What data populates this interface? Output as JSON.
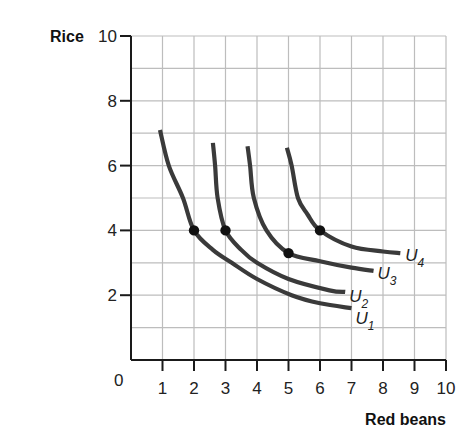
{
  "chart_data": {
    "type": "line",
    "title": "",
    "xlabel": "Red beans",
    "ylabel": "Rice",
    "xlim": [
      0,
      10
    ],
    "ylim": [
      0,
      10
    ],
    "grid": true,
    "x_ticks": [
      "0",
      "1",
      "2",
      "3",
      "4",
      "5",
      "6",
      "7",
      "8",
      "9",
      "10"
    ],
    "y_ticks": [
      "2",
      "4",
      "6",
      "8",
      "10"
    ],
    "origin_label": "0",
    "legend": "none (curves labeled inline)",
    "series": [
      {
        "name": "U1",
        "label_main": "U",
        "label_sub": "1",
        "points": [
          [
            0.92,
            7.1
          ],
          [
            1.2,
            6.0
          ],
          [
            1.65,
            5.0
          ],
          [
            2.0,
            4.0
          ],
          [
            2.6,
            3.4
          ],
          [
            3.2,
            3.0
          ],
          [
            4.0,
            2.5
          ],
          [
            5.1,
            2.0
          ],
          [
            6.0,
            1.75
          ],
          [
            7.0,
            1.6
          ]
        ]
      },
      {
        "name": "U2",
        "label_main": "U",
        "label_sub": "2",
        "points": [
          [
            2.6,
            6.7
          ],
          [
            2.67,
            6.0
          ],
          [
            2.75,
            5.0
          ],
          [
            3.0,
            4.0
          ],
          [
            3.5,
            3.4
          ],
          [
            4.0,
            3.0
          ],
          [
            5.0,
            2.5
          ],
          [
            6.3,
            2.15
          ],
          [
            6.8,
            2.1
          ]
        ]
      },
      {
        "name": "U3",
        "label_main": "U",
        "label_sub": "3",
        "points": [
          [
            3.7,
            6.6
          ],
          [
            3.78,
            6.0
          ],
          [
            3.9,
            5.0
          ],
          [
            4.3,
            4.0
          ],
          [
            5.0,
            3.3
          ],
          [
            6.0,
            3.05
          ],
          [
            7.0,
            2.85
          ],
          [
            7.7,
            2.75
          ]
        ]
      },
      {
        "name": "U4",
        "label_main": "U",
        "label_sub": "4",
        "points": [
          [
            4.95,
            6.55
          ],
          [
            5.1,
            6.0
          ],
          [
            5.3,
            5.0
          ],
          [
            5.6,
            4.5
          ],
          [
            6.0,
            4.0
          ],
          [
            7.0,
            3.5
          ],
          [
            8.0,
            3.35
          ],
          [
            8.55,
            3.3
          ]
        ]
      }
    ],
    "marked_points": [
      {
        "curve": "U1",
        "x": 2,
        "y": 4
      },
      {
        "curve": "U2",
        "x": 3,
        "y": 4
      },
      {
        "curve": "U3",
        "x": 5,
        "y": 3.3
      },
      {
        "curve": "U4",
        "x": 6,
        "y": 4
      }
    ],
    "colors": {
      "curve": "#3a3a3a",
      "grid": "#bdbdbd",
      "axis": "#1a1a1a",
      "dot": "#111111"
    }
  }
}
